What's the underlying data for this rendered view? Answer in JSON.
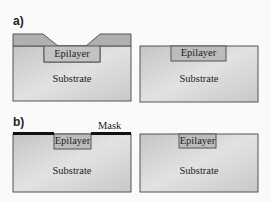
{
  "panels": {
    "a": {
      "label": "a)",
      "left": {
        "epilayer": "Epilayer",
        "substrate": "Substrate"
      },
      "right": {
        "epilayer": "Epilayer",
        "substrate": "Substrate"
      }
    },
    "b": {
      "label": "b)",
      "mask": "Mask",
      "left": {
        "epilayer": "Epilayer",
        "substrate": "Substrate"
      },
      "right": {
        "epilayer": "Epilayer",
        "substrate": "Substrate"
      }
    }
  },
  "colors": {
    "substrate": "#cfcfcf",
    "epilayer": "#bdbdbd",
    "overlayer": "#a9a9a9",
    "mask": "#111111",
    "outline": "#555555"
  }
}
